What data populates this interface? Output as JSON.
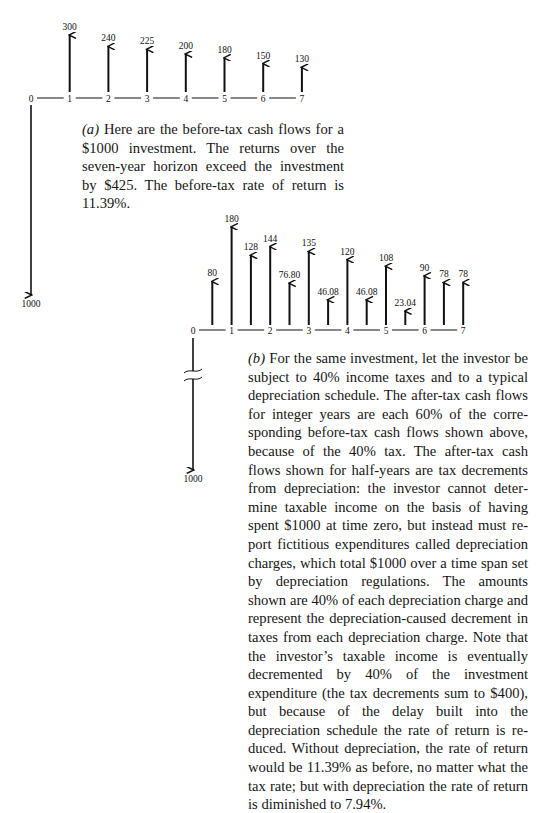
{
  "diagram_a": {
    "label": "(a)",
    "timeline_labels": [
      "0",
      "1",
      "2",
      "3",
      "4",
      "5",
      "6",
      "7"
    ],
    "investment": {
      "time": 0,
      "value": 1000,
      "label": "1000"
    },
    "cash_flows": [
      {
        "time": 1,
        "value": 300,
        "label": "300"
      },
      {
        "time": 2,
        "value": 240,
        "label": "240"
      },
      {
        "time": 3,
        "value": 225,
        "label": "225"
      },
      {
        "time": 4,
        "value": 200,
        "label": "200"
      },
      {
        "time": 5,
        "value": 180,
        "label": "180"
      },
      {
        "time": 6,
        "value": 150,
        "label": "150"
      },
      {
        "time": 7,
        "value": 130,
        "label": "130"
      }
    ],
    "caption_part": "(a)",
    "caption_text": " Here are the before-tax cash flows for a $1000 investment. The returns over the seven-year horizon exceed the investment by $425. The before-tax rate of return is 11.39%."
  },
  "diagram_b": {
    "label": "(b)",
    "timeline_labels": [
      "0",
      "1",
      "2",
      "3",
      "4",
      "5",
      "6",
      "7"
    ],
    "investment": {
      "time": 0,
      "value": 1000,
      "label": "1000",
      "broken_axis": true
    },
    "cash_flows": [
      {
        "time": 0.5,
        "value": 80,
        "label": "80",
        "kind": "tax-decrement"
      },
      {
        "time": 1,
        "value": 180,
        "label": "180",
        "kind": "after-tax"
      },
      {
        "time": 1.5,
        "value": 128,
        "label": "128",
        "kind": "tax-decrement"
      },
      {
        "time": 2,
        "value": 144,
        "label": "144",
        "kind": "after-tax"
      },
      {
        "time": 2.5,
        "value": 76.8,
        "label": "76.80",
        "kind": "tax-decrement"
      },
      {
        "time": 3,
        "value": 135,
        "label": "135",
        "kind": "after-tax"
      },
      {
        "time": 3.5,
        "value": 46.08,
        "label": "46.08",
        "kind": "tax-decrement"
      },
      {
        "time": 4,
        "value": 120,
        "label": "120",
        "kind": "after-tax"
      },
      {
        "time": 4.5,
        "value": 46.08,
        "label": "46.08",
        "kind": "tax-decrement"
      },
      {
        "time": 5,
        "value": 108,
        "label": "108",
        "kind": "after-tax"
      },
      {
        "time": 5.5,
        "value": 23.04,
        "label": "23.04",
        "kind": "tax-decrement"
      },
      {
        "time": 6,
        "value": 90,
        "label": "90",
        "kind": "after-tax"
      },
      {
        "time": 6.5,
        "value": 78,
        "label": "78",
        "kind": "tax-decrement"
      },
      {
        "time": 7,
        "value": 78,
        "label": "78",
        "kind": "after-tax"
      }
    ],
    "caption_part": "(b)",
    "caption_text": " For the same investment, let the investor be subject to 40% income taxes and to a typical depreciation schedule. The after-tax cash flows for integer years are each 60% of the corre­sponding before-tax cash flows shown above, because of the 40% tax. The after-tax cash flows shown for half-years are tax decrements from depreciation: the investor cannot deter­mine taxable income on the basis of having spent $1000 at time zero, but instead must re­port fictitious expenditures called depreciation charges, which total $1000 over a time span set by depreciation regulations. The amounts shown are 40% of each depreciation charge and represent the depreciation-caused decre­ment in taxes from each depreciation charge. Note that the investor’s taxable income is even­tually decremented by 40% of the investment expenditure (the tax decrements sum to $400), but because of the delay built into the depreciation schedule the rate of return is re­duced. Without depreciation, the rate of re­turn would be 11.39% as before, no matter what the tax rate; but with depreciation the rate of return is diminished to 7.94%."
  },
  "summary": {
    "before_tax_rate_of_return": "11.39%",
    "after_tax_rate_of_return": "7.94%",
    "investment": "$1000",
    "excess_returns": "$425",
    "tax_rate": "40%",
    "tax_decrements_sum": "$400"
  },
  "colors": {
    "ink": "#111111",
    "paper": "#ffffff"
  }
}
